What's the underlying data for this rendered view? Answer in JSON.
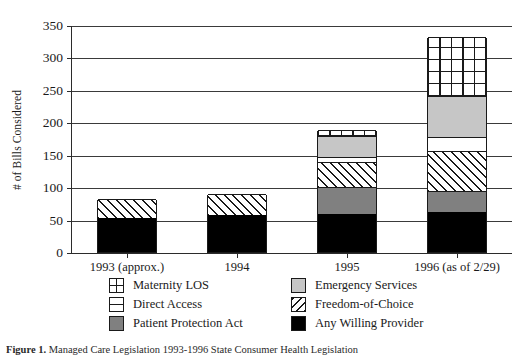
{
  "chart_data": {
    "type": "bar",
    "stacked": true,
    "title": "",
    "xlabel": "",
    "ylabel": "# of Bills Considered",
    "ylim": [
      0,
      350
    ],
    "ytick_step": 50,
    "yticks": [
      "350",
      "300",
      "250",
      "200",
      "150",
      "100",
      "50",
      "0"
    ],
    "grid": true,
    "grid_axis": "y",
    "legend_position": "bottom",
    "categories": [
      "1993 (approx.)",
      "1994",
      "1995",
      "1996 (as of 2/29)"
    ],
    "series": [
      {
        "name": "Any Willing Provider",
        "key": "any-willing-provider",
        "fill": "solid-black",
        "color": "#000000",
        "values": [
          52,
          57,
          59,
          62
        ]
      },
      {
        "name": "Patient Protection Act",
        "key": "patient-protection-act",
        "fill": "solid-dark-gray",
        "color": "#808080",
        "values": [
          0,
          0,
          41,
          32
        ]
      },
      {
        "name": "Freedom-of-Choice",
        "key": "freedom-of-choice",
        "fill": "diagonal-hatch",
        "color": "#ffffff",
        "values": [
          30,
          32,
          39,
          62
        ]
      },
      {
        "name": "Direct Access",
        "key": "direct-access",
        "fill": "horizontal-line",
        "color": "#ffffff",
        "values": [
          0,
          0,
          7,
          21
        ]
      },
      {
        "name": "Emergency Services",
        "key": "emergency-services",
        "fill": "solid-light-gray",
        "color": "#c6c6c6",
        "values": [
          0,
          0,
          33,
          63
        ]
      },
      {
        "name": "Maternity LOS",
        "key": "maternity-los",
        "fill": "cross-grid",
        "color": "#ffffff",
        "values": [
          0,
          0,
          9,
          91
        ]
      }
    ],
    "totals": [
      82,
      89,
      188,
      331
    ]
  },
  "axis": {
    "y_label": "# of Bills Considered",
    "y_ticks": [
      "350",
      "300",
      "250",
      "200",
      "150",
      "100",
      "50",
      "0"
    ]
  },
  "legend": {
    "items": [
      {
        "label": "Maternity LOS",
        "swatch": "cross-grid-swatch"
      },
      {
        "label": "Emergency Services",
        "swatch": "light-gray-swatch"
      },
      {
        "label": "Direct Access",
        "swatch": "horizontal-line-swatch"
      },
      {
        "label": "Freedom-of-Choice",
        "swatch": "diagonal-hatch-swatch"
      },
      {
        "label": "Patient Protection Act",
        "swatch": "dark-gray-swatch"
      },
      {
        "label": "Any Willing Provider",
        "swatch": "black-swatch"
      }
    ]
  },
  "caption": {
    "prefix": "Figure 1.",
    "text": "Managed Care Legislation 1993-1996 State Consumer Health Legislation"
  }
}
